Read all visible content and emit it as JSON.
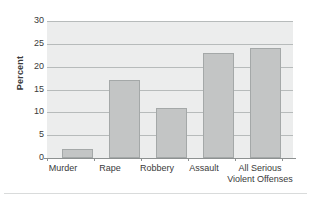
{
  "chart_data": {
    "type": "bar",
    "title": "",
    "xlabel": "",
    "ylabel": "Percent",
    "categories": [
      "Murder",
      "Rape",
      "Robbery",
      "Assault",
      "All Serious Violent Offenses"
    ],
    "category_lines": [
      [
        "Murder"
      ],
      [
        "Rape"
      ],
      [
        "Robbery"
      ],
      [
        "Assault"
      ],
      [
        "All Serious",
        "Violent Offenses"
      ]
    ],
    "values": [
      2,
      17,
      11,
      23,
      24
    ],
    "ylim": [
      0,
      30
    ],
    "yticks": [
      0,
      5,
      10,
      15,
      20,
      25,
      30
    ],
    "ytick_labels": [
      "0",
      "5",
      "10",
      "15",
      "20",
      "25",
      "30"
    ],
    "grid": true,
    "legend": false,
    "legend_position": "none",
    "colors": {
      "bar_fill": "#c3c5c5",
      "bar_border": "#a4a8a8",
      "plot_background": "#eceded",
      "gridline": "#b7bbbb",
      "axis_line": "#8d9191",
      "text": "#3a3a3a",
      "page_background": "#ffffff",
      "bottom_rule": "#d9dbdb"
    }
  }
}
